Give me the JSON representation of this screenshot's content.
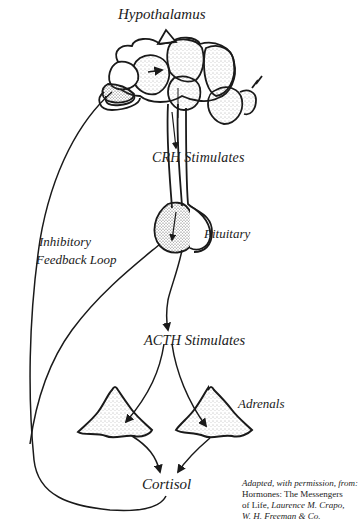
{
  "diagram": {
    "type": "hormone-feedback-flow",
    "labels": {
      "hypothalamus": "Hypothalamus",
      "crh": "CRH Stimulates",
      "pituitary": "Pituitary",
      "feedback_line1": "Inhibitory",
      "feedback_line2": "Feedback Loop",
      "acth": "ACTH Stimulates",
      "adrenals": "Adrenals",
      "cortisol": "Cortisol"
    },
    "credit": {
      "line1": "Adapted, with permission, from:",
      "line2": "Hormones: The Messengers",
      "line3_prefix": "of Life, ",
      "line3_author": "Laurence M. Crapo,",
      "line4": "W. H. Freeman & Co."
    },
    "nodes": [
      "Hypothalamus",
      "Pituitary",
      "Adrenals",
      "Cortisol"
    ],
    "edges": [
      {
        "from": "Hypothalamus",
        "to": "Pituitary",
        "label": "CRH Stimulates"
      },
      {
        "from": "Pituitary",
        "to": "Adrenals",
        "label": "ACTH Stimulates"
      },
      {
        "from": "Adrenals",
        "to": "Cortisol",
        "label": ""
      },
      {
        "from": "Cortisol",
        "to": "Hypothalamus",
        "label": "Inhibitory Feedback Loop"
      },
      {
        "from": "Cortisol",
        "to": "Pituitary",
        "label": "Inhibitory Feedback Loop"
      }
    ],
    "colors": {
      "ink": "#1a1a1a",
      "background": "#ffffff",
      "stipple": "#555555"
    }
  }
}
